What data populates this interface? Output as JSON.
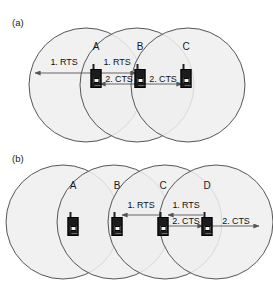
{
  "figure": {
    "width": 273,
    "height": 282,
    "background": "#ffffff",
    "circle_fill": "#eeeeee",
    "circle_stroke": "#444444",
    "arrow_color": "#555555",
    "device_color": "#1c1c1c",
    "text_color": "#111111"
  },
  "panels": [
    {
      "id": "a",
      "label": "(a)",
      "circles": [
        {
          "cx": 86,
          "cy": 85,
          "r": 57
        },
        {
          "cx": 137,
          "cy": 85,
          "r": 57
        },
        {
          "cx": 188,
          "cy": 85,
          "r": 57
        }
      ],
      "nodes": [
        {
          "id": "A",
          "letter": "A",
          "x": 96,
          "y": 46,
          "device_x": 96,
          "device_y": 76
        },
        {
          "id": "B",
          "letter": "B",
          "x": 140,
          "y": 46,
          "device_x": 140,
          "device_y": 76
        },
        {
          "id": "C",
          "letter": "C",
          "x": 186,
          "y": 46,
          "device_x": 186,
          "device_y": 76
        }
      ],
      "arrows": [
        {
          "id": "a-rts-left",
          "label": "1. RTS",
          "from_x": 92,
          "from_y": 73,
          "to_x": 35,
          "to_y": 73,
          "label_x": 64,
          "label_y": 62
        },
        {
          "id": "a-rts-a-b",
          "label": "1. RTS",
          "from_x": 100,
          "from_y": 73,
          "to_x": 136,
          "to_y": 73,
          "label_x": 117,
          "label_y": 62
        },
        {
          "id": "a-cts-b-a",
          "label": "2. CTS",
          "from_x": 136,
          "from_y": 84,
          "to_x": 100,
          "to_y": 84,
          "label_x": 119,
          "label_y": 79
        },
        {
          "id": "a-cts-b-c",
          "label": "2. CTS",
          "from_x": 145,
          "from_y": 84,
          "to_x": 182,
          "to_y": 84,
          "label_x": 163,
          "label_y": 79
        }
      ]
    },
    {
      "id": "b",
      "label": "(b)",
      "circles": [
        {
          "cx": 63,
          "cy": 222,
          "r": 57
        },
        {
          "cx": 114,
          "cy": 222,
          "r": 57
        },
        {
          "cx": 165,
          "cy": 222,
          "r": 57
        },
        {
          "cx": 216,
          "cy": 222,
          "r": 57
        }
      ],
      "nodes": [
        {
          "id": "A",
          "letter": "A",
          "x": 73,
          "y": 185,
          "device_x": 73,
          "device_y": 224
        },
        {
          "id": "B",
          "letter": "B",
          "x": 117,
          "y": 185,
          "device_x": 117,
          "device_y": 224
        },
        {
          "id": "C",
          "letter": "C",
          "x": 163,
          "y": 185,
          "device_x": 163,
          "device_y": 224
        },
        {
          "id": "D",
          "letter": "D",
          "x": 207,
          "y": 185,
          "device_x": 207,
          "device_y": 224
        }
      ],
      "arrows": [
        {
          "id": "b-rts-c-b",
          "label": "1. RTS",
          "from_x": 160,
          "from_y": 215,
          "to_x": 122,
          "to_y": 215,
          "label_x": 141,
          "label_y": 205
        },
        {
          "id": "b-rts-d-c",
          "label": "1. RTS",
          "from_x": 203,
          "from_y": 215,
          "to_x": 168,
          "to_y": 215,
          "label_x": 186,
          "label_y": 205
        },
        {
          "id": "b-cts-c-d",
          "label": "2. CTS",
          "from_x": 168,
          "from_y": 226,
          "to_x": 203,
          "to_y": 226,
          "label_x": 186,
          "label_y": 221
        },
        {
          "id": "b-cts-d-right",
          "label": "2. CTS",
          "from_x": 212,
          "from_y": 226,
          "to_x": 259,
          "to_y": 226,
          "label_x": 236,
          "label_y": 221
        }
      ]
    }
  ]
}
